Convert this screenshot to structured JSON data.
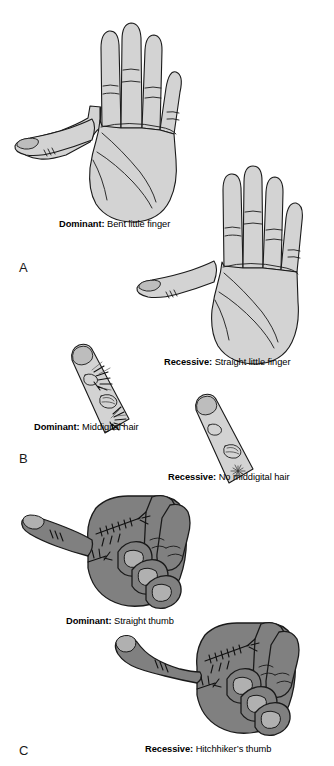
{
  "figure": {
    "background_color": "#ffffff",
    "width": 334,
    "height": 766
  },
  "colors": {
    "light_skin_fill": "#d3d3d3",
    "light_skin_shade": "#c2c2c2",
    "dark_skin_fill": "#808080",
    "dark_skin_shade": "#6e6e6e",
    "nail_fill": "#b7b7b7",
    "outline": "#1a1a1a",
    "text": "#000000"
  },
  "panels": [
    {
      "letter": "A",
      "trait": "little finger",
      "items": [
        {
          "lead": "Dominant:",
          "description": " Bent little finger",
          "illustration": "hand-palm-bent-little-finger"
        },
        {
          "lead": "Recessive:",
          "description": " Straight little finger",
          "illustration": "hand-palm-straight-little-finger"
        }
      ]
    },
    {
      "letter": "B",
      "trait": "middigital hair",
      "items": [
        {
          "lead": "Dominant:",
          "description": " Middigital hair",
          "illustration": "finger-with-middigital-hair"
        },
        {
          "lead": "Recessive:",
          "description": " No middigital hair",
          "illustration": "finger-without-middigital-hair"
        }
      ]
    },
    {
      "letter": "C",
      "trait": "thumb",
      "items": [
        {
          "lead": "Dominant:",
          "description": " Straight thumb",
          "illustration": "fist-straight-thumb"
        },
        {
          "lead": "Recessive:",
          "description": " Hitchhiker’s thumb",
          "illustration": "fist-hitchhikers-thumb"
        }
      ]
    }
  ]
}
